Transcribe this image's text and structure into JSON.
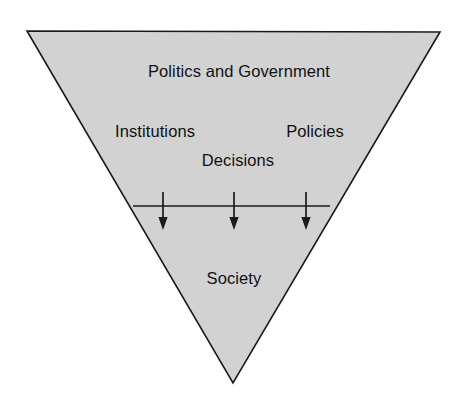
{
  "diagram": {
    "type": "inverted-triangle-flow",
    "shape_name": "inverted-triangle",
    "colors": {
      "background": "#ffffff",
      "triangle_fill": "#d2d2d2",
      "triangle_stroke": "#1a1a1a",
      "text": "#111111",
      "arrow": "#1a1a1a",
      "divider_line": "#1a1a1a"
    },
    "geometry": {
      "triangle_points": "27,31 440,32 233,383",
      "divider_line": {
        "x1": 133,
        "y1": 206,
        "x2": 330,
        "y2": 206
      },
      "arrow_x_positions": [
        163,
        234,
        306
      ],
      "arrow_y_start": 192,
      "arrow_y_end": 228
    },
    "labels": {
      "top": "Politics and Government",
      "left": "Institutions",
      "right": "Policies",
      "middle": "Decisions",
      "bottom": "Society"
    },
    "arrows": {
      "count": 3,
      "direction": "down",
      "semantic": "flow-from-government-to-society"
    }
  }
}
